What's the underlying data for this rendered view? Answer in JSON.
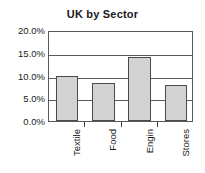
{
  "chart_data": {
    "type": "bar",
    "title": "UK by Sector",
    "xlabel": "",
    "ylabel": "",
    "categories": [
      "Textile",
      "Food",
      "Engin",
      "Stores"
    ],
    "values": [
      10.0,
      8.3,
      14.0,
      8.0
    ],
    "ylim": [
      0,
      20
    ],
    "yticks": [
      0,
      5,
      10,
      15,
      20
    ],
    "ytick_labels": [
      "0.0%",
      "5.0%",
      "10.0%",
      "15.0%",
      "20.0%"
    ],
    "grid": true,
    "legend": false,
    "bar_fill": "#d2d2d2",
    "bar_border": "#4a4a4a",
    "axis_color": "#5a5a5a",
    "text_color": "#1a1a1a",
    "background": "#ffffff"
  }
}
